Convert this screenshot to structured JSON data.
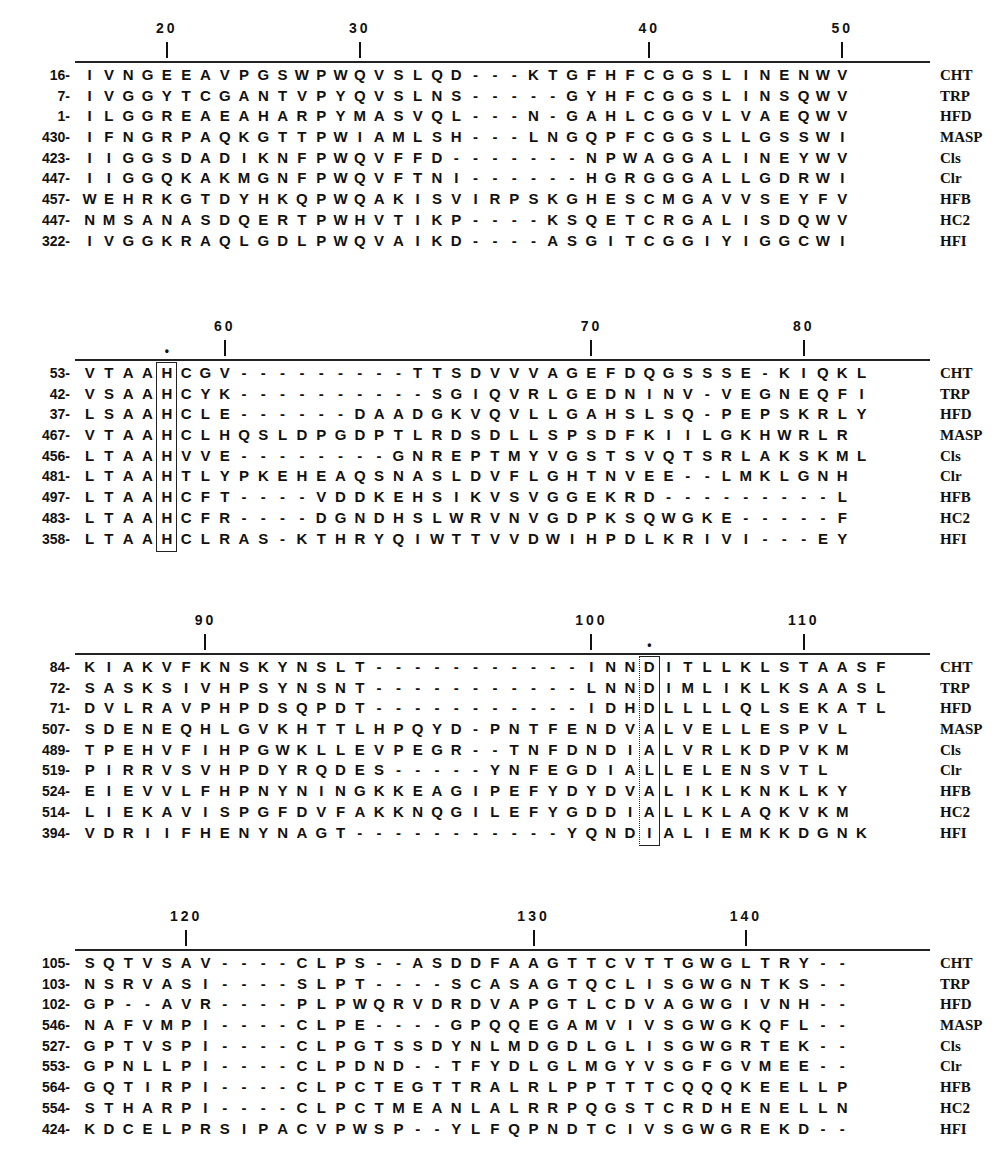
{
  "figure": {
    "type": "multiple sequence alignment",
    "sequence_names": [
      "CHT",
      "TRP",
      "HFD",
      "MASP",
      "Cls",
      "Clr",
      "HFB",
      "HC2",
      "HFI"
    ],
    "blocks": [
      {
        "ruler": [
          {
            "label": "20",
            "col": 4
          },
          {
            "label": "30",
            "col": 14
          },
          {
            "label": "40",
            "col": 29
          },
          {
            "label": "50",
            "col": 39
          }
        ],
        "markers": [],
        "rows": [
          {
            "pos": "16-",
            "seq": "IVNGEEAVPGSWPWQVSLQD---KTGFHFCGGSLINENWV",
            "name": "CHT"
          },
          {
            "pos": "7-",
            "seq": "IVGGYTCGANTVPYQVSLNS-----GYHFCGGSLINSQWV",
            "name": "TRP"
          },
          {
            "pos": "1-",
            "seq": "ILGGREAEAHARPYMASVQL---N-GAHLCGGVLVAEQWV",
            "name": "HFD"
          },
          {
            "pos": "430-",
            "seq": "IFNGRPAQKGTTPWIAMLSH---LNGQPFCGGSLLGSSWI",
            "name": "MASP"
          },
          {
            "pos": "423-",
            "seq": "IIGGSDADIKNFPWQVFFD-------NPWAGGALINEYWV",
            "name": "Cls"
          },
          {
            "pos": "447-",
            "seq": "IIGGQKAKMGNFPWQVFTNI------HGRGGGALLGDRWI",
            "name": "Clr"
          },
          {
            "pos": "457-",
            "seq": "WEHRKGTDYHKQPWQAKISVIRPSKGHESCMGAVVSEYFV",
            "name": "HFB"
          },
          {
            "pos": "447-",
            "seq": "NMSANASDQERTPWHVTIKP----KSQETCRGALISDQWV",
            "name": "HC2"
          },
          {
            "pos": "322-",
            "seq": "IVGGKRAQLGDLPWQVAIKD----ASGITCGGIYIGGCWI",
            "name": "HFI"
          }
        ]
      },
      {
        "ruler": [
          {
            "label": "60",
            "col": 7
          },
          {
            "label": "70",
            "col": 26
          },
          {
            "label": "80",
            "col": 37
          }
        ],
        "markers": [
          {
            "symbol": "•",
            "col": 4
          }
        ],
        "boxed_column": 4,
        "rows": [
          {
            "pos": "53-",
            "seq": "VTAAHCGV---------TTSDVVVAGEFDQGSSSE-KIQKL",
            "name": "CHT"
          },
          {
            "pos": "42-",
            "seq": "VSAAHCYK----------SGIQVRLGEDNINV-VEGNEQFI",
            "name": "TRP"
          },
          {
            "pos": "37-",
            "seq": "LSAAHCLE------DAADGKVQVLLGAHSLSQ-PEPSKRLY",
            "name": "HFD"
          },
          {
            "pos": "467-",
            "seq": "VTAAHCLHQSLDPGDPTLRDSDLLSPSDFKIILGKHWRLR",
            "name": "MASP"
          },
          {
            "pos": "456-",
            "seq": "LTAAHVVE--------GNREPTMYVGSTSVQTSRLAKSKML",
            "name": "Cls"
          },
          {
            "pos": "481-",
            "seq": "LTAAHTLYPKEHEAQSNASLDVFLGHTNVEE--LMKLGNH",
            "name": "Clr"
          },
          {
            "pos": "497-",
            "seq": "LTAAHCFT----VDDKEHSIKVSVGGEKRD---------L",
            "name": "HFB"
          },
          {
            "pos": "483-",
            "seq": "LTAAHCFR----DGNDHSLWRVNVGDPKSQWGKE-----F",
            "name": "HC2"
          },
          {
            "pos": "358-",
            "seq": "LTAAHCLRAS-KTHRYQIWTTVVDWIHPDLKRIVI---EY",
            "name": "HFI"
          }
        ]
      },
      {
        "ruler": [
          {
            "label": "90",
            "col": 6
          },
          {
            "label": "100",
            "col": 26
          },
          {
            "label": "110",
            "col": 37
          }
        ],
        "markers": [
          {
            "symbol": "•",
            "col": 29
          }
        ],
        "boxed_column": 29,
        "rows": [
          {
            "pos": "84-",
            "seq": "KIAKVFKNSKYNSLT-----------INNDITLLKLSTAASF",
            "name": "CHT"
          },
          {
            "pos": "72-",
            "seq": "SASKSIVHPSYNSNT-----------LNNDIMLIKLKSAASL",
            "name": "TRP"
          },
          {
            "pos": "71-",
            "seq": "DVLRAVPHPDSQPDT-----------IDHDLLLLQLSEKATL",
            "name": "HFD"
          },
          {
            "pos": "507-",
            "seq": "SDENEQHLGVKHTTLHPQYD-PNTFENDVALVELLESPVL",
            "name": "MASP"
          },
          {
            "pos": "489-",
            "seq": "TPEHVFIHPGWKLLEVPEGR--TNFDNDIALVRLKDPVKM",
            "name": "Cls"
          },
          {
            "pos": "519-",
            "seq": "PIRRVSVHPDYRQDES-----YNFEGDIALLELENSVTL",
            "name": "Clr"
          },
          {
            "pos": "524-",
            "seq": "EIEVVLFHPNYNINGKKEAGIPEFYDYDVALIKLKNKLKY",
            "name": "HFB"
          },
          {
            "pos": "514-",
            "seq": "LIEKAVISPGFDVFAKKNQGILEFYGDDIALLKLAQKVKM",
            "name": "HC2"
          },
          {
            "pos": "394-",
            "seq": "VDRIIFHENYNAGT-----------YQNDIALIEMKKDGNK",
            "name": "HFI"
          }
        ]
      },
      {
        "ruler": [
          {
            "label": "120",
            "col": 5
          },
          {
            "label": "130",
            "col": 23
          },
          {
            "label": "140",
            "col": 34
          }
        ],
        "markers": [],
        "rows": [
          {
            "pos": "105-",
            "seq": "SQTVSAV----CLPS--ASDDFAAGTTCVTTGWGLTRY--",
            "name": "CHT"
          },
          {
            "pos": "103-",
            "seq": "NSRVASI----SLPT----SCASAGTQCLISGWGNTKS--",
            "name": "TRP"
          },
          {
            "pos": "102-",
            "seq": "GP--AVR----PLPWQRVDRDVAPGTLCDVAGWGIVNH--",
            "name": "HFD"
          },
          {
            "pos": "546-",
            "seq": "NAFVMPI----CLPE----GPQQEGAMVIVSGWGKQFL--",
            "name": "MASP"
          },
          {
            "pos": "527-",
            "seq": "GPTVSPI----CLPGTSSDYNLMDGDLGLISGWGRTEK--",
            "name": "Cls"
          },
          {
            "pos": "553-",
            "seq": "GPNLLPI----CLPDND--TFYDLGLMGYVSGFGVMEE--",
            "name": "Clr"
          },
          {
            "pos": "564-",
            "seq": "GQTIRPI----CLPCTEGTTRALRLPPTTTCQQQKEELLP",
            "name": "HFB"
          },
          {
            "pos": "554-",
            "seq": "STHARPI----CLPCTMEANLALRRPQGSTCRDHENELLN",
            "name": "HC2"
          },
          {
            "pos": "424-",
            "seq": "KDCELPRSIPACVPWSP--YLFQPNDTCIVSGWGREKD--",
            "name": "HFI"
          }
        ]
      }
    ]
  }
}
